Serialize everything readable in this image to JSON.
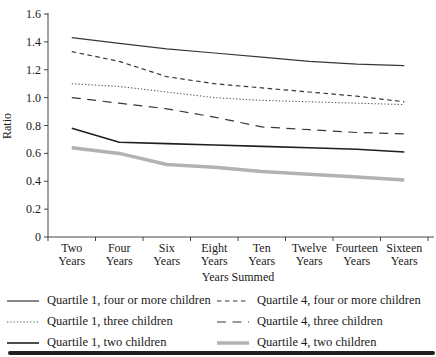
{
  "chart_data": {
    "type": "line",
    "title": "",
    "xlabel": "Years Summed",
    "ylabel": "Ratio",
    "ylim": [
      0,
      1.6
    ],
    "ytick_step": 0.2,
    "y_ticks": [
      "0",
      "0.2",
      "0.4",
      "0.6",
      "0.8",
      "1.0",
      "1.2",
      "1.4",
      "1.6"
    ],
    "grid": "off",
    "legend_position": "below-two-columns",
    "categories": [
      "Two Years",
      "Four Years",
      "Six Years",
      "Eight Years",
      "Ten Years",
      "Twelve Years",
      "Fourteen Years",
      "Sixteen Years"
    ],
    "series": [
      {
        "name": "Quartile 1, four or more children",
        "line_style": "solid-thin",
        "color": "#383838",
        "width": 1.2,
        "dash": "",
        "values": [
          1.43,
          1.39,
          1.35,
          1.32,
          1.29,
          1.26,
          1.24,
          1.23
        ]
      },
      {
        "name": "Quartile 4, four or more children",
        "line_style": "dashed",
        "color": "#383838",
        "width": 1.2,
        "dash": "4.5,3.5",
        "values": [
          1.33,
          1.26,
          1.15,
          1.1,
          1.07,
          1.04,
          1.01,
          0.97
        ]
      },
      {
        "name": "Quartile 1, three children",
        "line_style": "dotted",
        "color": "#5a5a5a",
        "width": 1.1,
        "dash": "1.3,2",
        "values": [
          1.1,
          1.08,
          1.04,
          1.0,
          0.98,
          0.97,
          0.96,
          0.95
        ]
      },
      {
        "name": "Quartile 4, three children",
        "line_style": "long-dash",
        "color": "#383838",
        "width": 1.2,
        "dash": "9,6.5",
        "values": [
          1.0,
          0.96,
          0.92,
          0.86,
          0.79,
          0.77,
          0.75,
          0.74
        ]
      },
      {
        "name": "Quartile 1, two children",
        "line_style": "solid",
        "color": "#1f1f1f",
        "width": 1.6,
        "dash": "",
        "values": [
          0.78,
          0.68,
          0.67,
          0.66,
          0.65,
          0.64,
          0.63,
          0.61
        ]
      },
      {
        "name": "Quartile 4, two children",
        "line_style": "solid-thick-gray",
        "color": "#b2b2b2",
        "width": 3.5,
        "dash": "",
        "values": [
          0.64,
          0.6,
          0.52,
          0.5,
          0.47,
          0.45,
          0.43,
          0.41
        ]
      }
    ]
  },
  "bottom_rule_color": "#1f1f1f"
}
